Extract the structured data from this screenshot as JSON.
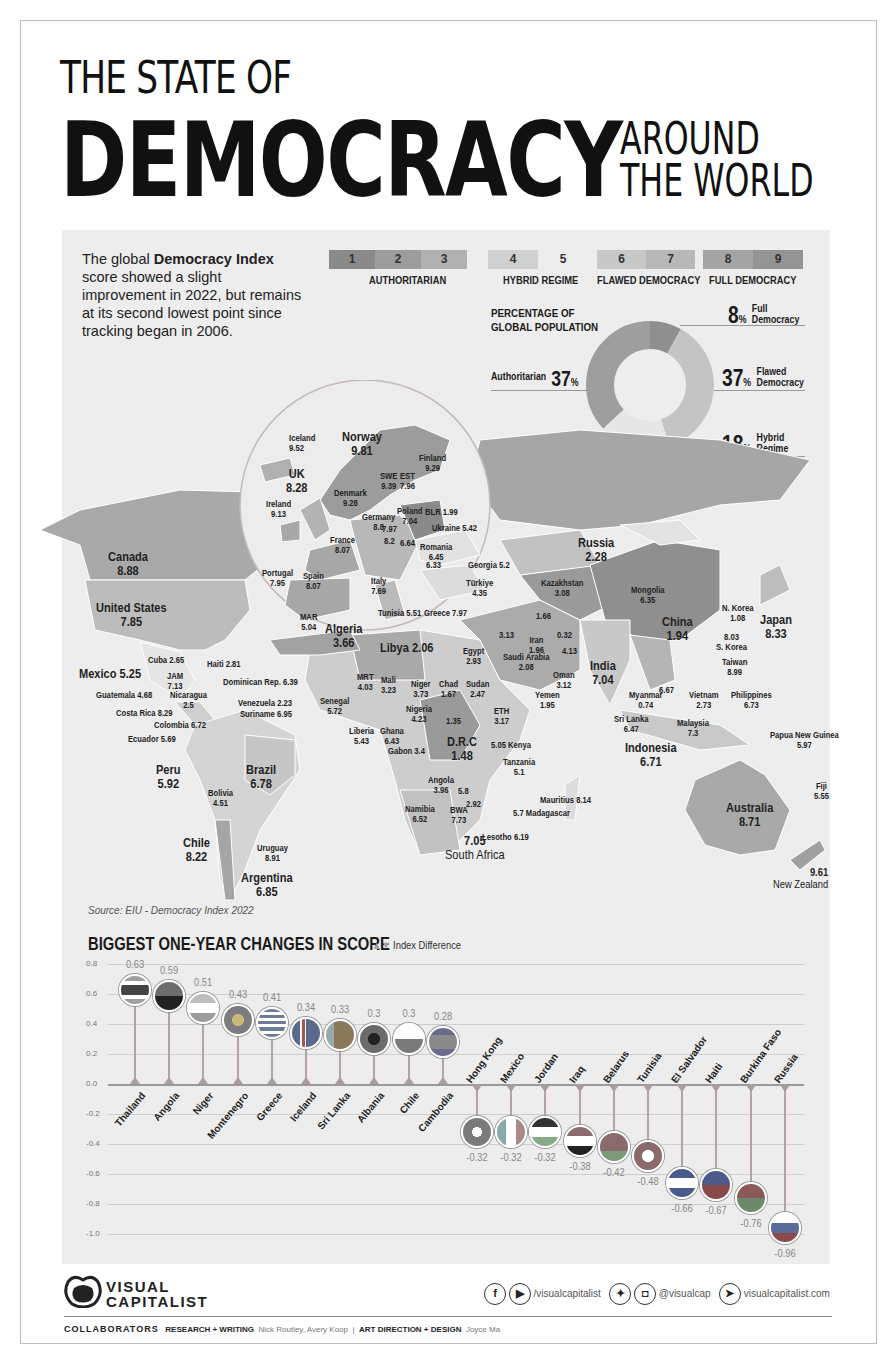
{
  "title": {
    "line1": "THE STATE OF",
    "main": "DEMOCRACY",
    "side1": "AROUND",
    "side2": "THE WORLD"
  },
  "intro": {
    "pre": "The global ",
    "bold1": "Democracy",
    "bold2": "Index",
    "post": " score showed a slight improvement in 2022, but remains at its second lowest point since tracking began in 2006."
  },
  "scale": {
    "cells": [
      "1",
      "2",
      "3",
      "4",
      "5",
      "6",
      "7",
      "8",
      "9"
    ],
    "colors": [
      "#8a8a8a",
      "#9c9c9c",
      "#b0b0b0",
      "#d0d0d0",
      "#e8e8e8",
      "#c8c8c8",
      "#b8b8b8",
      "#a4a4a4",
      "#949494"
    ],
    "groups": [
      "AUTHORITARIAN",
      "HYBRID REGIME",
      "FLAWED DEMOCRACY",
      "FULL DEMOCRACY"
    ]
  },
  "population": {
    "title1": "PERCENTAGE OF",
    "title2": "GLOBAL POPULATION",
    "segments": [
      {
        "label": "Full Democracy",
        "l1": "Full",
        "l2": "Democracy",
        "value": "8",
        "color": "#8f8f8f"
      },
      {
        "label": "Flawed Democracy",
        "l1": "Flawed",
        "l2": "Democracy",
        "value": "37",
        "color": "#c4c4c4"
      },
      {
        "label": "Hybrid Regime",
        "l1": "Hybrid",
        "l2": "Regime",
        "value": "18",
        "color": "#e6e6e6"
      },
      {
        "label": "Authoritarian",
        "l1": "Authoritarian",
        "l2": "",
        "value": "37",
        "color": "#9e9e9e"
      }
    ],
    "pct_sign": "%"
  },
  "map": {
    "labels": [
      {
        "name": "Iceland",
        "value": "9.52"
      },
      {
        "name": "Norway",
        "value": "9.81"
      },
      {
        "name": "Finland",
        "value": "9.29"
      },
      {
        "name": "UK",
        "value": "8.28"
      },
      {
        "name": "SWE",
        "value": "9.39"
      },
      {
        "name": "EST",
        "value": "7.96"
      },
      {
        "name": "Denmark",
        "value": "9.28"
      },
      {
        "name": "Ireland",
        "value": "9.13"
      },
      {
        "name": "Germany",
        "value": "8.8"
      },
      {
        "name": "Poland",
        "value": "7.04"
      },
      {
        "name": "BLR",
        "value": "1.99"
      },
      {
        "name": "CZE",
        "value": "7.97"
      },
      {
        "name": "AUT",
        "value": "8.2"
      },
      {
        "name": "HUN",
        "value": "6.64"
      },
      {
        "name": "Ukraine",
        "value": "5.42"
      },
      {
        "name": "France",
        "value": "8.07"
      },
      {
        "name": "Romania",
        "value": "6.45"
      },
      {
        "name": "SRB",
        "value": "6.33"
      },
      {
        "name": "Georgia",
        "value": "5.2"
      },
      {
        "name": "Portugal",
        "value": "7.95"
      },
      {
        "name": "Spain",
        "value": "8.07"
      },
      {
        "name": "Italy",
        "value": "7.69"
      },
      {
        "name": "Türkiye",
        "value": "4.35"
      },
      {
        "name": "MAR",
        "value": "5.04"
      },
      {
        "name": "Algeria",
        "value": "3.66"
      },
      {
        "name": "Tunisia",
        "value": "5.51"
      },
      {
        "name": "Greece",
        "value": "7.97"
      },
      {
        "name": "Libya",
        "value": "2.06"
      },
      {
        "name": "Canada",
        "value": "8.88"
      },
      {
        "name": "United States",
        "value": "7.85"
      },
      {
        "name": "Mexico",
        "value": "5.25"
      },
      {
        "name": "Cuba",
        "value": "2.65"
      },
      {
        "name": "Haiti",
        "value": "2.81"
      },
      {
        "name": "JAM",
        "value": "7.13"
      },
      {
        "name": "Dominican Rep.",
        "value": "6.39"
      },
      {
        "name": "Guatemala",
        "value": "4.68"
      },
      {
        "name": "Nicaragua",
        "value": "2.5"
      },
      {
        "name": "Venezuela",
        "value": "2.23"
      },
      {
        "name": "Costa Rica",
        "value": "8.29"
      },
      {
        "name": "Suriname",
        "value": "6.95"
      },
      {
        "name": "Colombia",
        "value": "6.72"
      },
      {
        "name": "Ecuador",
        "value": "5.69"
      },
      {
        "name": "Peru",
        "value": "5.92"
      },
      {
        "name": "Brazil",
        "value": "6.78"
      },
      {
        "name": "Bolivia",
        "value": "4.51"
      },
      {
        "name": "Chile",
        "value": "8.22"
      },
      {
        "name": "Uruguay",
        "value": "8.91"
      },
      {
        "name": "Argentina",
        "value": "6.85"
      },
      {
        "name": "Russia",
        "value": "2.28"
      },
      {
        "name": "Kazakhstan",
        "value": "3.08"
      },
      {
        "name": "Mongolia",
        "value": "6.35"
      },
      {
        "name": "N. Korea",
        "value": "1.08"
      },
      {
        "name": "Japan",
        "value": "8.33"
      },
      {
        "name": "China",
        "value": "1.94"
      },
      {
        "name": "S. Korea",
        "value": "8.03"
      },
      {
        "name": "Taiwan",
        "value": "8.99"
      },
      {
        "name": "Iran",
        "value": "1.96"
      },
      {
        "name": "AFG",
        "value": "0.32"
      },
      {
        "name": "TKM",
        "value": "1.66"
      },
      {
        "name": "SYR",
        "value": "3.13"
      },
      {
        "name": "PAK",
        "value": "4.13"
      },
      {
        "name": "India",
        "value": "7.04"
      },
      {
        "name": "Egypt",
        "value": "2.93"
      },
      {
        "name": "Saudi Arabia",
        "value": "2.08"
      },
      {
        "name": "Oman",
        "value": "3.12"
      },
      {
        "name": "Yemen",
        "value": "1.95"
      },
      {
        "name": "MRT",
        "value": "4.03"
      },
      {
        "name": "Mali",
        "value": "3.23"
      },
      {
        "name": "Niger",
        "value": "3.73"
      },
      {
        "name": "Chad",
        "value": "1.67"
      },
      {
        "name": "Sudan",
        "value": "2.47"
      },
      {
        "name": "Senegal",
        "value": "5.72"
      },
      {
        "name": "Nigeria",
        "value": "4.23"
      },
      {
        "name": "CAR",
        "value": "1.35"
      },
      {
        "name": "ETH",
        "value": "3.17"
      },
      {
        "name": "Liberia",
        "value": "5.43"
      },
      {
        "name": "Ghana",
        "value": "6.43"
      },
      {
        "name": "D.R.C",
        "value": "1.48"
      },
      {
        "name": "Kenya",
        "value": "5.05"
      },
      {
        "name": "Gabon",
        "value": "3.4"
      },
      {
        "name": "Tanzania",
        "value": "5.1"
      },
      {
        "name": "Angola",
        "value": "3.96"
      },
      {
        "name": "ZMB",
        "value": "5.8"
      },
      {
        "name": "ZWE",
        "value": "2.92"
      },
      {
        "name": "Namibia",
        "value": "6.52"
      },
      {
        "name": "BWA",
        "value": "7.73"
      },
      {
        "name": "Mauritius",
        "value": "8.14"
      },
      {
        "name": "Madagascar",
        "value": "5.7"
      },
      {
        "name": "South Africa",
        "value": "7.05"
      },
      {
        "name": "Lesotho",
        "value": "6.19"
      },
      {
        "name": "Myanmar",
        "value": "0.74"
      },
      {
        "name": "THA",
        "value": "6.67"
      },
      {
        "name": "Vietnam",
        "value": "2.73"
      },
      {
        "name": "Philippines",
        "value": "6.73"
      },
      {
        "name": "Sri Lanka",
        "value": "6.47"
      },
      {
        "name": "Malaysia",
        "value": "7.3"
      },
      {
        "name": "Indonesia",
        "value": "6.71"
      },
      {
        "name": "Papua New Guinea",
        "value": "5.97"
      },
      {
        "name": "Australia",
        "value": "8.71"
      },
      {
        "name": "Fiji",
        "value": "5.55"
      },
      {
        "name": "New Zealand",
        "value": "9.61"
      }
    ],
    "source": "Source: EIU - Democracy Index 2022"
  },
  "chart": {
    "title": "BIGGEST ONE-YEAR CHANGES IN SCORE",
    "legend": "Index Difference",
    "yticks": [
      "0.8",
      "0.6",
      "0.4",
      "0.2",
      "0.0",
      "-0.2",
      "-0.4",
      "-0.6",
      "-0.8",
      "-1.0"
    ]
  },
  "chart_data": {
    "type": "bar",
    "title": "BIGGEST ONE-YEAR CHANGES IN SCORE",
    "subtitle": "Index Difference",
    "xlabel": "",
    "ylabel": "",
    "ylim": [
      -1.0,
      0.8
    ],
    "grid": true,
    "categories": [
      "Thailand",
      "Angola",
      "Niger",
      "Montenegro",
      "Greece",
      "Iceland",
      "Sri Lanka",
      "Albania",
      "Chile",
      "Cambodia",
      "Hong Kong",
      "Mexico",
      "Jordan",
      "Iraq",
      "Belarus",
      "Tunisia",
      "El Salvador",
      "Haiti",
      "Burkina Faso",
      "Russia"
    ],
    "values": [
      0.63,
      0.59,
      0.51,
      0.43,
      0.41,
      0.34,
      0.33,
      0.3,
      0.3,
      0.28,
      -0.32,
      -0.32,
      -0.32,
      -0.38,
      -0.42,
      -0.48,
      -0.66,
      -0.67,
      -0.76,
      -0.96
    ],
    "value_labels": [
      "0.63",
      "0.59",
      "0.51",
      "0.43",
      "0.41",
      "0.34",
      "0.33",
      "0.3",
      "0.3",
      "0.28",
      "-0.32",
      "-0.32",
      "-0.32",
      "-0.38",
      "-0.42",
      "-0.48",
      "-0.66",
      "-0.67",
      "-0.76",
      "-0.96"
    ]
  },
  "footer": {
    "brand1": "VISUAL",
    "brand2": "CAPITALIST",
    "social1": "/visualcapitalist",
    "social2": "@visualcap",
    "website": "visualcapitalist.com",
    "collab_label": "COLLABORATORS",
    "research_label": "RESEARCH + WRITING",
    "research_names": "Nick Routley, Avery Koop",
    "sep": "|",
    "design_label": "ART DIRECTION + DESIGN",
    "design_names": "Joyce Ma"
  }
}
